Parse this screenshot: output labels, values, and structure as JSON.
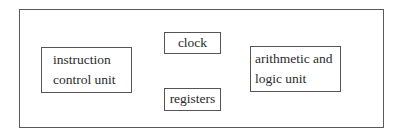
{
  "diagram": {
    "title": "",
    "colors": {
      "border": "#555555",
      "text": "#2a2a2a",
      "background": "#ffffff"
    },
    "container": {
      "label": ""
    },
    "boxes": [
      {
        "id": "instruction-control-unit",
        "lines": [
          "instruction",
          "control unit"
        ]
      },
      {
        "id": "clock",
        "lines": [
          "clock"
        ]
      },
      {
        "id": "registers",
        "lines": [
          "registers"
        ]
      },
      {
        "id": "arithmetic-logic-unit",
        "lines": [
          "arithmetic and",
          "logic unit"
        ]
      }
    ]
  }
}
